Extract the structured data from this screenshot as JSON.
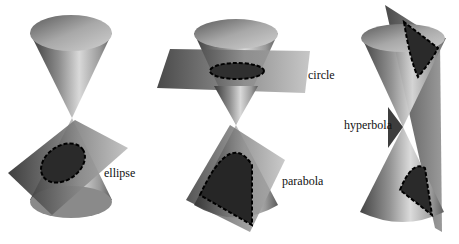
{
  "diagram": {
    "panels": [
      {
        "id": "ellipse-panel",
        "label": "ellipse"
      },
      {
        "id": "circle-parabola-panel",
        "labels": [
          "circle",
          "parabola"
        ]
      },
      {
        "id": "hyperbola-panel",
        "label": "hyperbola"
      }
    ]
  },
  "labels": {
    "ellipse": "ellipse",
    "circle": "circle",
    "parabola": "parabola",
    "hyperbola": "hyperbola"
  }
}
